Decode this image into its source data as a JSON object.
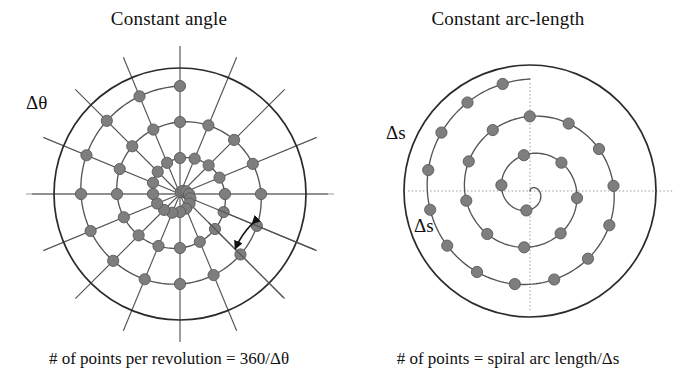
{
  "figure": {
    "background": "#ffffff",
    "width": 677,
    "height": 375
  },
  "style": {
    "dot_fill": "#7e7e7e",
    "dot_stroke": "#5a5a5a",
    "line_color": "#555555",
    "circle_color": "#2b2b2b",
    "axis_color": "#9a9a9a",
    "text_color": "#111111",
    "dot_radius": 5.6
  },
  "panels": [
    {
      "id": "constant-angle",
      "title": "Constant angle",
      "caption": "# of points per revolution = 360/Δθ",
      "annotation": "Δθ",
      "annotation_kind": "angle-arc-double-arrow",
      "center": {
        "x": 180,
        "y": 194
      },
      "outer_radius": 126,
      "spokes": 16,
      "spoke_overshoot": 22,
      "spiral": {
        "turns": 3.0,
        "r_max": 108,
        "start_angle_deg": 0
      },
      "sampling": "constant-angle",
      "points_per_revolution": 16,
      "has_radial_spokes": true,
      "has_solid_axes": true
    },
    {
      "id": "constant-arc-length",
      "title": "Constant arc-length",
      "caption": "# of points = spiral arc length/Δs",
      "annotation": "Δs",
      "annotation_kind": "segment-label",
      "annotation_count": 2,
      "center": {
        "x": 191,
        "y": 191
      },
      "outer_radius": 126,
      "spokes": 0,
      "spoke_overshoot": 0,
      "spiral": {
        "turns": 3.0,
        "r_max": 112,
        "start_angle_deg": 0
      },
      "sampling": "constant-arc-length",
      "arc_step": 40,
      "has_radial_spokes": false,
      "has_solid_axes": false
    }
  ],
  "chart_data": {
    "type": "scatter",
    "series": [
      {
        "name": "Constant angle",
        "description": "Points placed at equal angular increments along an Archimedean spiral; samples crowd near the centre.",
        "angular_step_deg": 22.5,
        "points_per_revolution": 16,
        "spiral_turns": 3,
        "formula": "# of points per revolution = 360/Δθ"
      },
      {
        "name": "Constant arc-length",
        "description": "Points placed at equal arc-length increments along an Archimedean spiral; samples are uniformly spaced.",
        "arc_step": "Δs",
        "spiral_turns": 3,
        "formula": "# of points = spiral arc length/Δs"
      }
    ],
    "legend": "none",
    "grid": false
  }
}
